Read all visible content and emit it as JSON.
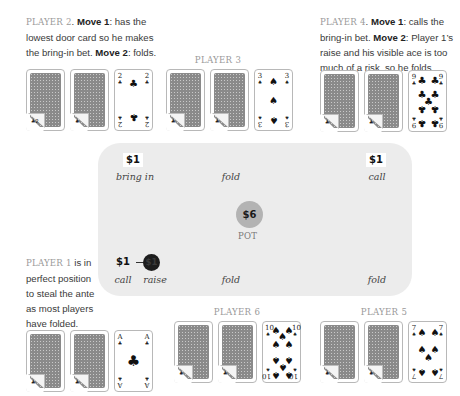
{
  "players": {
    "p2": {
      "label": "PLAYER 2",
      "text": [
        {
          "t": "PLAYER 2",
          "style": "label"
        },
        {
          "t": ". ",
          "style": "plain"
        },
        {
          "t": "Move 1",
          "style": "bold"
        },
        {
          "t": ": has the lowest door card so he makes the bring-in bet. ",
          "style": "plain"
        },
        {
          "t": "Move 2",
          "style": "bold"
        },
        {
          "t": ": folds.",
          "style": "plain"
        }
      ],
      "upcard": {
        "rank": "2",
        "suit": "♣",
        "suit_name": "clubs"
      }
    },
    "p3": {
      "label": "PLAYER 3",
      "upcard": {
        "rank": "3",
        "suit": "♠",
        "suit_name": "spades"
      }
    },
    "p4": {
      "label": "PLAYER 4",
      "text": [
        {
          "t": "PLAYER 4",
          "style": "label"
        },
        {
          "t": ". ",
          "style": "plain"
        },
        {
          "t": "Move 1",
          "style": "bold"
        },
        {
          "t": ": calls the bring-in bet. ",
          "style": "plain"
        },
        {
          "t": "Move 2",
          "style": "bold"
        },
        {
          "t": ": Player 1’s raise and his visible ace is too much of a risk, so he folds.",
          "style": "plain"
        }
      ],
      "upcard": {
        "rank": "9",
        "suit": "♣",
        "suit_name": "clubs"
      }
    },
    "p1": {
      "label": "PLAYER 1",
      "text": [
        {
          "t": "PLAYER 1",
          "style": "label"
        },
        {
          "t": " is in perfect position to steal the ante as most players have folded.",
          "style": "plain"
        }
      ],
      "upcard": {
        "rank": "A",
        "suit": "♣",
        "suit_name": "clubs"
      }
    },
    "p6": {
      "label": "PLAYER 6",
      "upcard": {
        "rank": "10",
        "suit": "♠",
        "suit_name": "spades"
      }
    },
    "p5": {
      "label": "PLAYER 5",
      "upcard": {
        "rank": "7",
        "suit": "♠",
        "suit_name": "spades"
      }
    }
  },
  "table": {
    "p2": {
      "amount": "$1",
      "action": "bring in"
    },
    "p3": {
      "action": "fold"
    },
    "p4": {
      "amount": "$1",
      "action": "call"
    },
    "p1": {
      "amount": "$1",
      "action_call": "call",
      "raise_amount": "$1",
      "action_raise": "raise"
    },
    "p6": {
      "action": "fold"
    },
    "p5": {
      "action": "fold"
    },
    "pot": {
      "amount": "$6",
      "label": "POT"
    }
  },
  "colors": {
    "table_bg": "#ececec",
    "pot_chip": "#b3b3b3",
    "raise_chip": "#1d1d1d",
    "player_label": "#9a9a9a"
  }
}
